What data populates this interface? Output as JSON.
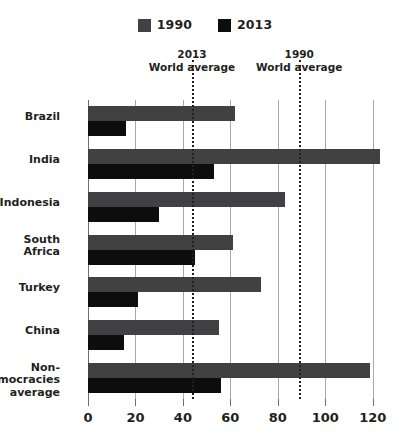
{
  "legend": {
    "items": [
      {
        "label": "1990",
        "color": "#414042",
        "name": "legend-swatch-1990"
      },
      {
        "label": "2013",
        "color": "#0d0d0d",
        "name": "legend-swatch-2013"
      }
    ]
  },
  "annotations": [
    {
      "line1": "2013",
      "line2": "World average",
      "value": 43.8
    },
    {
      "line1": "1990",
      "line2": "World average",
      "value": 89.0
    }
  ],
  "chart_data": {
    "type": "bar",
    "orientation": "horizontal",
    "title": "",
    "xlabel": "",
    "ylabel": "",
    "xlim": [
      0,
      126
    ],
    "xticks": [
      0,
      20,
      40,
      60,
      80,
      100,
      120
    ],
    "grid": true,
    "legend_position": "top-center",
    "categories": [
      "Brazil",
      "India",
      "Indonesia",
      "South Africa",
      "Turkey",
      "China",
      "Non-democracies average"
    ],
    "series": [
      {
        "name": "1990",
        "color": "#414042",
        "values": [
          62,
          123,
          83,
          61,
          73,
          55,
          119
        ]
      },
      {
        "name": "2013",
        "color": "#0d0d0d",
        "values": [
          16,
          53,
          30,
          45,
          21,
          15,
          56
        ]
      }
    ],
    "reference_lines": [
      {
        "label": "2013 World average",
        "value": 43.8
      },
      {
        "label": "1990 World average",
        "value": 89.0
      }
    ]
  }
}
